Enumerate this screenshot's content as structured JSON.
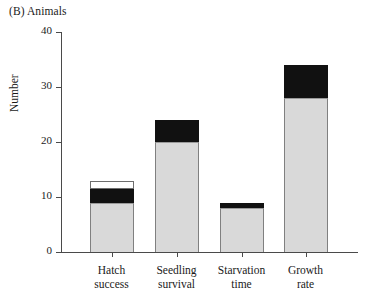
{
  "figure": {
    "panel_label": "(B) Animals"
  },
  "chart_data": {
    "type": "bar",
    "title": "(B) Animals",
    "xlabel": "",
    "ylabel": "Number",
    "ylim": [
      0,
      40
    ],
    "yticks": [
      0,
      10,
      20,
      30,
      40
    ],
    "ytick_labels": [
      "0",
      "10",
      "20",
      "30",
      "40"
    ],
    "grid": false,
    "legend": "none",
    "stacked": true,
    "categories": [
      "Hatch\nsuccess",
      "Seedling\nsurvival",
      "Starvation\ntime",
      "Growth\nrate"
    ],
    "category_lines": [
      [
        "Hatch",
        "success"
      ],
      [
        "Seedling",
        "survival"
      ],
      [
        "Starvation",
        "time"
      ],
      [
        "Growth",
        "rate"
      ]
    ],
    "series": [
      {
        "name": "gray",
        "color": "#d9d9d9",
        "values": [
          9,
          20,
          8,
          28
        ]
      },
      {
        "name": "black",
        "color": "#111111",
        "values": [
          2.5,
          4,
          0.9,
          6
        ]
      },
      {
        "name": "white",
        "color": "#ffffff",
        "values": [
          1.5,
          0,
          0,
          0
        ]
      }
    ],
    "totals": [
      13,
      24,
      8.9,
      34
    ],
    "bar_segment_tops": {
      "hatch_success": {
        "gray_top": 9,
        "black_top": 11.5,
        "white_top": 13
      },
      "seedling_survival": {
        "gray_top": 20,
        "black_top": 24,
        "white_top": 24
      },
      "starvation_time": {
        "gray_top": 8,
        "black_top": 8.9,
        "white_top": 8.9
      },
      "growth_rate": {
        "gray_top": 28,
        "black_top": 34,
        "white_top": 34
      }
    }
  },
  "colors": {
    "axis": "#4a4a4a",
    "bar_gray": "#d9d9d9",
    "bar_black": "#111111",
    "bar_white": "#ffffff",
    "background": "#ffffff"
  }
}
